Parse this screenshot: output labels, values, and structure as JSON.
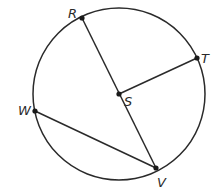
{
  "diagram": {
    "type": "geometry-circle",
    "circle": {
      "center": "S",
      "cx": 119,
      "cy": 94,
      "r": 86
    },
    "points": {
      "R": {
        "label": "R",
        "x": 82,
        "y": 18
      },
      "T": {
        "label": "T",
        "x": 197,
        "y": 58
      },
      "S": {
        "label": "S",
        "x": 119,
        "y": 94
      },
      "W": {
        "label": "W",
        "x": 35,
        "y": 111
      },
      "V": {
        "label": "V",
        "x": 156,
        "y": 168
      }
    },
    "segments": [
      {
        "name": "RV",
        "from": "R",
        "to": "V",
        "kind": "diameter"
      },
      {
        "name": "ST",
        "from": "S",
        "to": "T",
        "kind": "radius"
      },
      {
        "name": "WV",
        "from": "W",
        "to": "V",
        "kind": "chord"
      }
    ],
    "stroke_color": "#2a2a2a"
  }
}
